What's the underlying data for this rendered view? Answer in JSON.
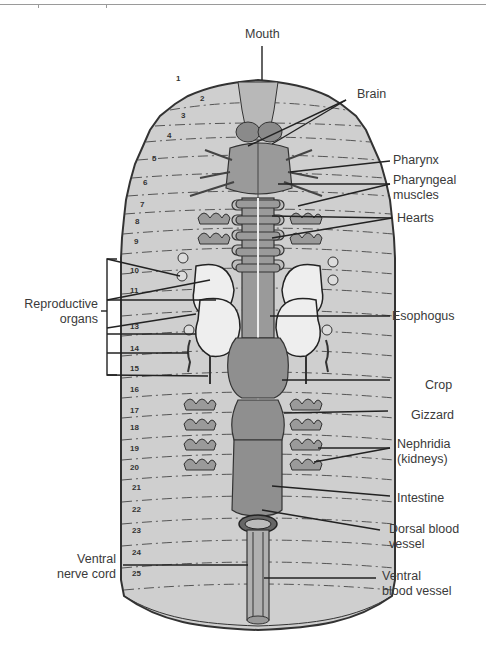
{
  "figure": {
    "colors": {
      "body_fill": "#cfcfcf",
      "organ_dark": "#8a8a8a",
      "organ_mid": "#a8a8a8",
      "reproductive_fill": "#eeeeee",
      "outline": "#333333",
      "label_text": "#3a3a3a"
    }
  },
  "labels": {
    "mouth": "Mouth",
    "brain": "Brain",
    "pharynx": "Pharynx",
    "pharyngeal_muscles_1": "Pharyngeal",
    "pharyngeal_muscles_2": "muscles",
    "hearts": "Hearts",
    "reproductive_organs_1": "Reproductive",
    "reproductive_organs_2": "organs",
    "esophogus": "Esophogus",
    "crop": "Crop",
    "gizzard": "Gizzard",
    "nephridia_1": "Nephridia",
    "nephridia_2": "(kidneys)",
    "intestine": "Intestine",
    "dorsal_blood_vessel_1": "Dorsal blood",
    "dorsal_blood_vessel_2": "vessel",
    "ventral_nerve_cord_1": "Ventral",
    "ventral_nerve_cord_2": "nerve cord",
    "ventral_blood_vessel_1": "Ventral",
    "ventral_blood_vessel_2": "blood vessel"
  },
  "segments": [
    "1",
    "2",
    "3",
    "4",
    "5",
    "6",
    "7",
    "8",
    "9",
    "10",
    "11",
    "13",
    "14",
    "15",
    "16",
    "17",
    "18",
    "19",
    "20",
    "21",
    "22",
    "23",
    "24",
    "25"
  ]
}
